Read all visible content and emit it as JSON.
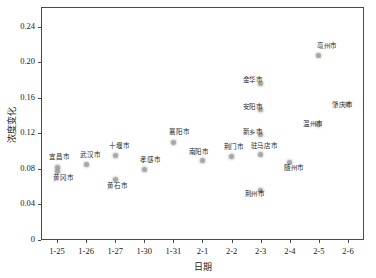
{
  "chart_data": {
    "type": "scatter",
    "title": "",
    "xlabel": "日期",
    "ylabel": "浓度变化",
    "grid": false,
    "legend": "none",
    "x_tick_labels": [
      "1-25",
      "1-26",
      "1-27",
      "1-30",
      "1-31",
      "2-1",
      "2-2",
      "2-3",
      "2-4",
      "2-5",
      "2-6"
    ],
    "y_tick_labels": [
      "0",
      "0.04",
      "0.08",
      "0.12",
      "0.16",
      "0.20",
      "0.24"
    ],
    "y_tick_values": [
      0,
      0.04,
      0.08,
      0.12,
      0.16,
      0.2,
      0.24
    ],
    "ylim": [
      0,
      0.262
    ],
    "xlim": [
      -0.55,
      10.55
    ],
    "marker_color": "#9a9a9a",
    "axis_color": "#4a4a4a",
    "points": [
      {
        "label": "宜昌市",
        "x_category": "1-25",
        "x_index": 0,
        "y": 0.081,
        "label_dx": -8,
        "label_dy": -13
      },
      {
        "label": "黄冈市",
        "x_category": "1-25",
        "x_index": 0,
        "y": 0.077,
        "label_dx": -4,
        "label_dy": 4
      },
      {
        "label": "武汉市",
        "x_category": "1-26",
        "x_index": 1,
        "y": 0.085,
        "label_dx": -6,
        "label_dy": -11
      },
      {
        "label": "十堰市",
        "x_category": "1-27",
        "x_index": 2,
        "y": 0.095,
        "label_dx": -6,
        "label_dy": -12
      },
      {
        "label": "黄石市",
        "x_category": "1-27",
        "x_index": 2,
        "y": 0.068,
        "label_dx": -8,
        "label_dy": 4
      },
      {
        "label": "孝感市",
        "x_category": "1-30",
        "x_index": 3,
        "y": 0.079,
        "label_dx": -4,
        "label_dy": -12
      },
      {
        "label": "襄阳市",
        "x_category": "1-31",
        "x_index": 4,
        "y": 0.11,
        "label_dx": -4,
        "label_dy": -12
      },
      {
        "label": "南阳市",
        "x_category": "2-1",
        "x_index": 5,
        "y": 0.089,
        "label_dx": -14,
        "label_dy": -11
      },
      {
        "label": "荆门市",
        "x_category": "2-2",
        "x_index": 6,
        "y": 0.094,
        "label_dx": -8,
        "label_dy": -11
      },
      {
        "label": "金华市",
        "x_category": "2-3",
        "x_index": 7,
        "y": 0.176,
        "label_dx": -18,
        "label_dy": -5
      },
      {
        "label": "安阳市",
        "x_category": "2-3",
        "x_index": 7,
        "y": 0.147,
        "label_dx": -18,
        "label_dy": -4
      },
      {
        "label": "新乡市",
        "x_category": "2-3",
        "x_index": 7,
        "y": 0.119,
        "label_dx": -18,
        "label_dy": -4
      },
      {
        "label": "驻马店市",
        "x_category": "2-3",
        "x_index": 7,
        "y": 0.096,
        "label_dx": -10,
        "label_dy": -11
      },
      {
        "label": "荆州市",
        "x_category": "2-3",
        "x_index": 7,
        "y": 0.056,
        "label_dx": -16,
        "label_dy": 2
      },
      {
        "label": "随州市",
        "x_category": "2-4",
        "x_index": 8,
        "y": 0.087,
        "label_dx": -6,
        "label_dy": 3
      },
      {
        "label": "亳州市",
        "x_category": "2-5",
        "x_index": 9,
        "y": 0.208,
        "label_dx": -2,
        "label_dy": -11
      },
      {
        "label": "温州市",
        "x_category": "2-5",
        "x_index": 9,
        "y": 0.13,
        "label_dx": -16,
        "label_dy": -2
      },
      {
        "label": "肇庆市",
        "x_category": "2-6",
        "x_index": 10,
        "y": 0.152,
        "label_dx": -16,
        "label_dy": -2
      }
    ]
  },
  "plot_geometry": {
    "left": 41,
    "top": 7,
    "width": 323,
    "height": 233
  }
}
